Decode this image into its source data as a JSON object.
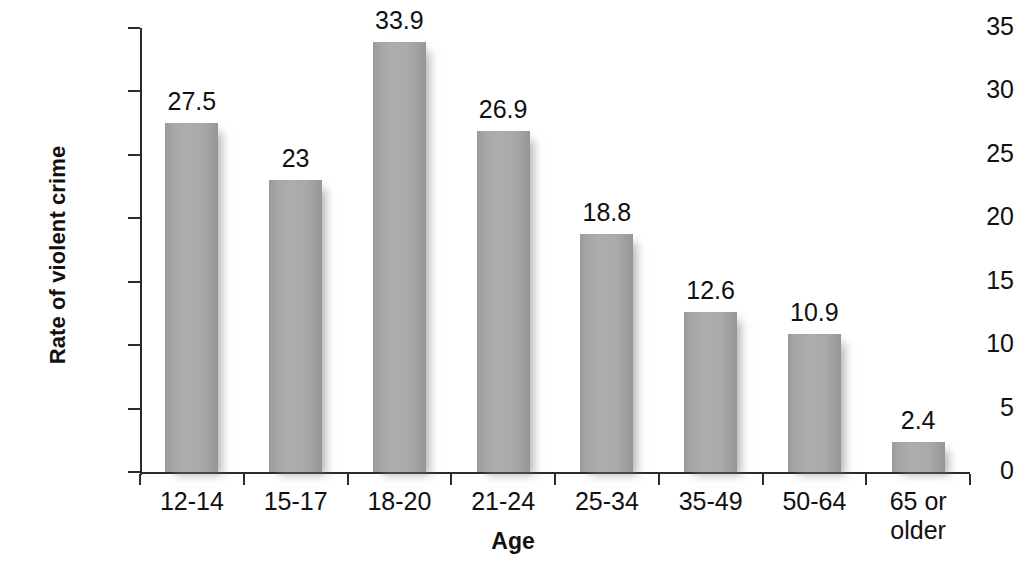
{
  "chart_data": {
    "type": "bar",
    "title": "",
    "subtitle": "",
    "xlabel": "Age",
    "ylabel": "Rate of violent crime",
    "categories": [
      "12-14",
      "15-17",
      "18-20",
      "21-24",
      "25-34",
      "35-49",
      "50-64",
      "65 or\nolder"
    ],
    "values": [
      27.5,
      23,
      33.9,
      26.9,
      18.8,
      12.6,
      10.9,
      2.4
    ],
    "value_labels": [
      "27.5",
      "23",
      "33.9",
      "26.9",
      "18.8",
      "12.6",
      "10.9",
      "2.4"
    ],
    "ylim": [
      0,
      35
    ],
    "ytick_labels": [
      "0",
      "5",
      "10",
      "15",
      "20",
      "25",
      "30",
      "35"
    ],
    "ytick_values": [
      0,
      5,
      10,
      15,
      20,
      25,
      30,
      35
    ],
    "grid": false,
    "legend": null,
    "bar_color": "#a6a6a6",
    "axis_color": "#2b2b2b",
    "text_color": "#111111",
    "background_color": "#ffffff"
  }
}
